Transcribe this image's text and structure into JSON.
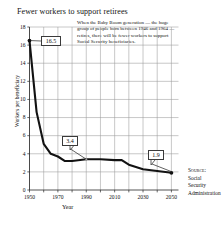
{
  "chart_data": {
    "type": "line",
    "title": "Fewer workers to support retirees",
    "xlabel": "Year",
    "ylabel": "Workers per beneficiary",
    "xlim": [
      1950,
      2055
    ],
    "ylim": [
      0,
      18
    ],
    "grid": true,
    "legend": "none",
    "xticks": [
      "1950",
      "1970",
      "1990",
      "2010",
      "2030",
      "2050"
    ],
    "xtick_values": [
      1950,
      1970,
      1990,
      2010,
      2030,
      2050
    ],
    "yticks": [
      "0",
      "2",
      "4",
      "6",
      "8",
      "10",
      "12",
      "14",
      "16",
      "18"
    ],
    "ytick_values": [
      0,
      2,
      4,
      6,
      8,
      10,
      12,
      14,
      16,
      18
    ],
    "series": [
      {
        "name": "Workers per Social Security beneficiary",
        "x": [
          1950,
          1955,
          1960,
          1965,
          1970,
          1975,
          1980,
          1990,
          2000,
          2010,
          2015,
          2020,
          2030,
          2040,
          2050
        ],
        "values": [
          16.5,
          8.6,
          5.1,
          4.0,
          3.7,
          3.2,
          3.2,
          3.4,
          3.4,
          3.3,
          3.3,
          2.8,
          2.3,
          2.1,
          1.9
        ]
      }
    ],
    "annotations": [
      {
        "label": "16.5",
        "x": 1950,
        "y": 16.5
      },
      {
        "label": "3.4",
        "x": 1990,
        "y": 3.4
      },
      {
        "label": "1.9",
        "x": 2050,
        "y": 1.9
      }
    ],
    "note": "When the Baby Boom generation — the huge group of people born between 1946 and 1964 — retires, there will be fewer workers to support Social Security beneficiaries.",
    "source_label": "Source:",
    "source_lines": [
      "Social",
      "Security",
      "Administration"
    ]
  }
}
